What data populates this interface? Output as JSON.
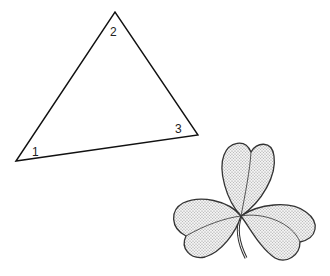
{
  "figure": {
    "triangle": {
      "vertices": [
        {
          "label": "1",
          "x": 16,
          "y": 161
        },
        {
          "label": "2",
          "x": 115,
          "y": 12
        },
        {
          "label": "3",
          "x": 198,
          "y": 135
        }
      ],
      "labels": {
        "v1": "1",
        "v2": "2",
        "v3": "3"
      },
      "stroke": "#111111"
    },
    "clover": {
      "leaves": 3,
      "fill": "#d9d9d9",
      "stroke": "#333333",
      "has_stem": true
    }
  }
}
